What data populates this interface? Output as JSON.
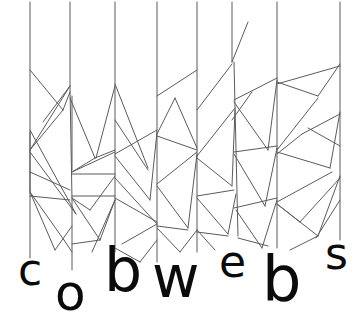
{
  "artwork": {
    "title": "cobwebs",
    "word": "cobwebs",
    "background_color": "#ffffff",
    "web_line_color": "#5b5b5b",
    "web_line_width": 1,
    "letter_color": "#0b0b0b",
    "canvas": {
      "width": 364,
      "height": 325
    }
  },
  "letters": [
    {
      "char": "c",
      "x": 18,
      "y": 248,
      "size": 44
    },
    {
      "char": "o",
      "x": 55,
      "y": 268,
      "size": 50
    },
    {
      "char": "b",
      "x": 104,
      "y": 240,
      "size": 60
    },
    {
      "char": "w",
      "x": 152,
      "y": 248,
      "size": 58
    },
    {
      "char": "e",
      "x": 219,
      "y": 240,
      "size": 44
    },
    {
      "char": "b",
      "x": 262,
      "y": 248,
      "size": 62
    },
    {
      "char": "s",
      "x": 325,
      "y": 232,
      "size": 44
    }
  ],
  "threads": {
    "vertical_x_positions": [
      30,
      70,
      115,
      157,
      197,
      232,
      277,
      340
    ],
    "thread_top": 0,
    "description": "vertical web threads from which the letters dangle"
  },
  "web_strands": {
    "count": 64,
    "description": "angular cobweb strands connecting the vertical threads"
  }
}
